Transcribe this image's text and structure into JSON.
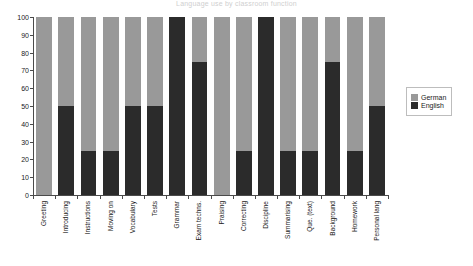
{
  "chart_data": {
    "type": "bar",
    "subtype": "stacked-percentage",
    "title": "Language use by classroom function",
    "xlabel": "",
    "ylabel": "",
    "ylim": [
      0,
      100
    ],
    "ytick_step": 10,
    "yticks": [
      100,
      90,
      80,
      70,
      60,
      50,
      40,
      30,
      20,
      10,
      0
    ],
    "grid": false,
    "legend_position": "right",
    "categories": [
      "Greeting",
      "Introducing",
      "Instructions",
      "Moving on",
      "Vocabulary",
      "Tests",
      "Grammar",
      "Exam techns.",
      "Praising",
      "Correcting",
      "Discipline",
      "Summarising",
      "Que. (text)",
      "Background",
      "Homework",
      "Personal lang"
    ],
    "series": [
      {
        "name": "German",
        "color": "#999999",
        "values": [
          100,
          50,
          75,
          75,
          50,
          50,
          0,
          25,
          100,
          75,
          0,
          75,
          75,
          25,
          75,
          50
        ]
      },
      {
        "name": "English",
        "color": "#2b2b2b",
        "values": [
          0,
          50,
          25,
          25,
          50,
          50,
          100,
          75,
          0,
          25,
          100,
          25,
          25,
          75,
          25,
          50
        ]
      }
    ]
  },
  "legend": {
    "items": [
      {
        "label": "German",
        "color": "#999999"
      },
      {
        "label": "English",
        "color": "#2b2b2b"
      }
    ]
  }
}
